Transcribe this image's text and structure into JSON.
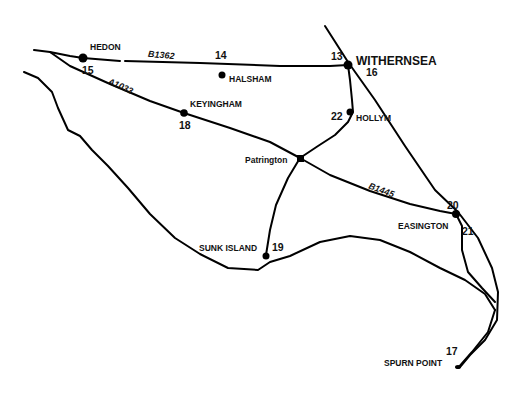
{
  "map": {
    "type": "road-map",
    "region": "Holderness peninsula",
    "places": [
      {
        "name": "HEDON",
        "number": "15"
      },
      {
        "name": "HALSHAM",
        "number": "14"
      },
      {
        "name": "WITHERNSEA",
        "number": "13",
        "number_alt": "16"
      },
      {
        "name": "KEYINGHAM",
        "number": "18"
      },
      {
        "name": "HOLLYM",
        "number": "22"
      },
      {
        "name": "Patrington",
        "number": ""
      },
      {
        "name": "EASINGTON",
        "number": "20",
        "number_alt": "21"
      },
      {
        "name": "SUNK ISLAND",
        "number": "19"
      },
      {
        "name": "SPURN POINT",
        "number": "17"
      }
    ],
    "roads": [
      {
        "name": "B1362"
      },
      {
        "name": "A1033"
      },
      {
        "name": "B1445"
      }
    ],
    "colors": {
      "ink": "#000000",
      "background": "#ffffff"
    }
  }
}
